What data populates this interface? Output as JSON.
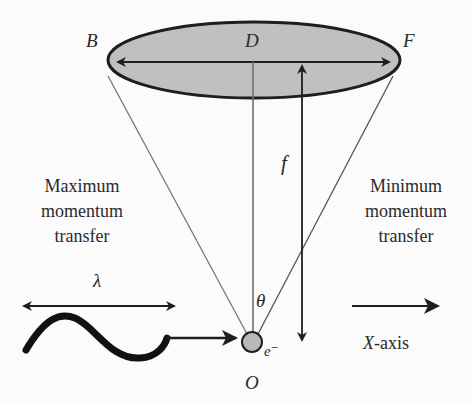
{
  "diagram": {
    "points": {
      "B": "B",
      "D": "D",
      "F": "F",
      "O": "O"
    },
    "symbols": {
      "focal": "f",
      "angle": "θ",
      "wavelength": "λ",
      "electron": "e⁻"
    },
    "left_label": [
      "Maximum",
      "momentum",
      "transfer"
    ],
    "right_label": [
      "Minimum",
      "momentum",
      "transfer"
    ],
    "axis_label": {
      "var": "X",
      "rest": "-axis"
    },
    "colors": {
      "ellipse_fill": "#c0c0c0",
      "stroke": "#1e1e1e",
      "cone_line": "#707070",
      "electron_fill": "#b8b8b8"
    }
  }
}
